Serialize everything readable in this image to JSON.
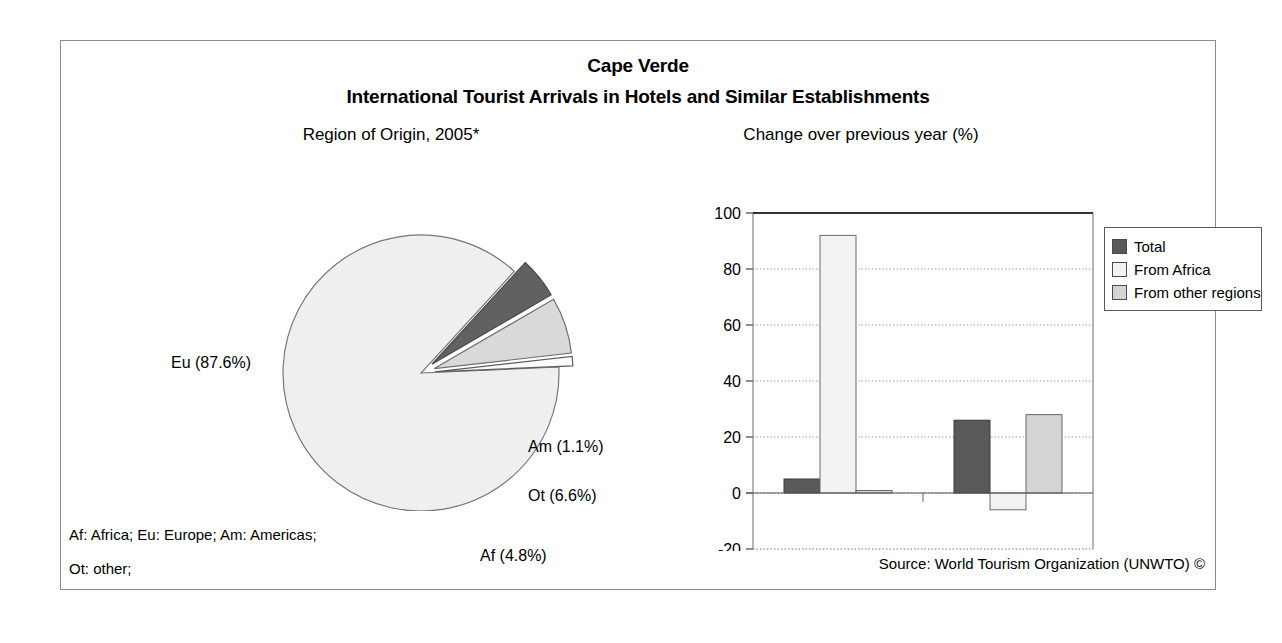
{
  "header": {
    "title": "Cape Verde",
    "subtitle": "International Tourist Arrivals in Hotels and Similar Establishments"
  },
  "panels": {
    "pie_title": "Region of Origin, 2005*",
    "bar_title": "Change over previous year (%)"
  },
  "pie_labels": {
    "eu": "Eu (87.6%)",
    "am": "Am (1.1%)",
    "ot": "Ot (6.6%)",
    "af": "Af (4.8%)"
  },
  "legend": {
    "items": [
      {
        "label": "Total",
        "color": "#595959"
      },
      {
        "label": "From Africa",
        "color": "#f2f2f2"
      },
      {
        "label": "From other regions",
        "color": "#d4d4d4"
      }
    ]
  },
  "footer": {
    "note_line1": "Af: Africa; Eu: Europe; Am: Americas;",
    "note_line2": "Ot: other;",
    "source": "Source: World Tourism Organization (UNWTO) ©"
  },
  "axis": {
    "y_ticks": [
      "100",
      "80",
      "60",
      "40",
      "20",
      "0",
      "-20"
    ],
    "x_categories": [
      "2004/2003",
      "2005*/2004"
    ]
  },
  "colors": {
    "total": "#595959",
    "from_africa": "#f2f2f2",
    "other_regions": "#d4d4d4",
    "pie_eu": "#efefef",
    "pie_am": "#fbfbfb",
    "pie_ot": "#d9d9d9",
    "pie_af": "#616161",
    "frame": "#8a8a8a",
    "gridline": "#9a9a9a"
  },
  "chart_data": [
    {
      "type": "pie",
      "title": "Region of Origin, 2005*",
      "labels": [
        "Eu",
        "Af",
        "Ot",
        "Am"
      ],
      "label_texts": [
        "Eu (87.6%)",
        "Af (4.8%)",
        "Ot (6.6%)",
        "Am (1.1%)"
      ],
      "values": [
        87.6,
        4.8,
        6.6,
        1.1
      ],
      "units": "percent",
      "exploded": [
        "Af",
        "Ot",
        "Am"
      ],
      "colors": [
        "#efefef",
        "#616161",
        "#d9d9d9",
        "#fbfbfb"
      ],
      "legend": "inline-labels"
    },
    {
      "type": "bar",
      "title": "Change over previous year (%)",
      "categories": [
        "2004/2003",
        "2005*/2004"
      ],
      "series": [
        {
          "name": "Total",
          "values": [
            5,
            26
          ]
        },
        {
          "name": "From Africa",
          "values": [
            92,
            -6
          ]
        },
        {
          "name": "From other regions",
          "values": [
            0.5,
            28
          ]
        }
      ],
      "xlabel": "",
      "ylabel": "",
      "ylim": [
        -20,
        100
      ],
      "ytick_step": 20,
      "grid": true,
      "legend_position": "right"
    }
  ]
}
